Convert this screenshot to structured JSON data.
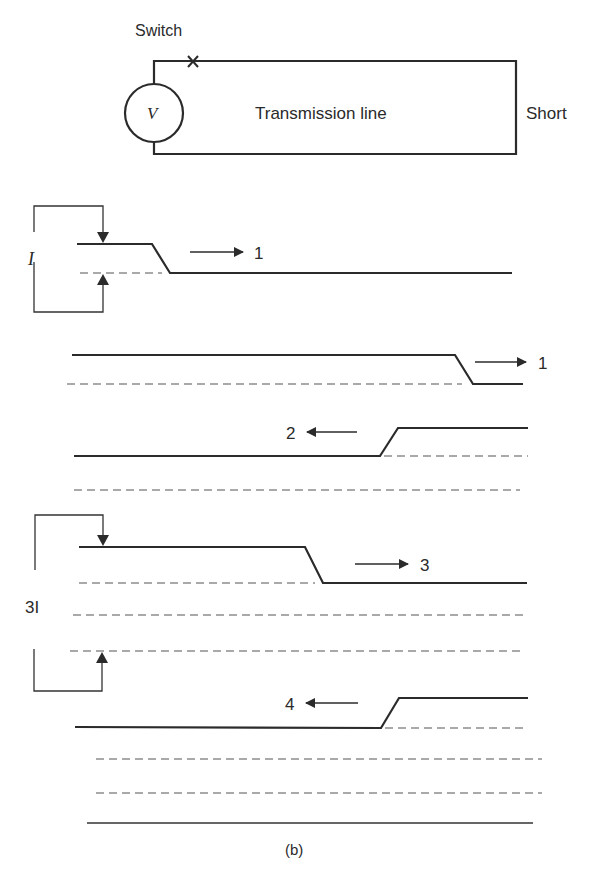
{
  "figure": {
    "caption": "(b)",
    "circuit": {
      "switch_label": "Switch",
      "source_label": "V",
      "line_label": "Transmission line",
      "load_label": "Short"
    },
    "current_labels": {
      "initial": "I",
      "final": "3I"
    },
    "wave_steps": [
      {
        "step": "1",
        "direction": "right"
      },
      {
        "step": "1",
        "direction": "right"
      },
      {
        "step": "2",
        "direction": "left"
      },
      {
        "step": "3",
        "direction": "right"
      },
      {
        "step": "4",
        "direction": "left"
      }
    ]
  },
  "colors": {
    "background": "#ffffff",
    "ink": "#2b2b2b",
    "dashed": "#555555"
  }
}
